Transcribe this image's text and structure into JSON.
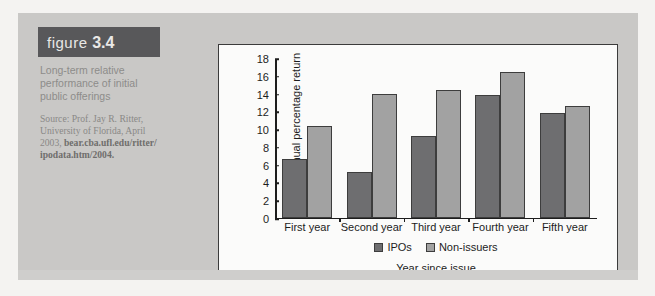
{
  "figure": {
    "label_prefix": "figure",
    "number": "3.4",
    "caption_lines": [
      "Long-term relative",
      "performance of initial",
      "public offerings"
    ],
    "source_lines": [
      "Source: Prof. Jay R. Ritter,",
      "University of Florida, April",
      "2003, bear.cba.ufl.edu/ritter/",
      "ipodata.htm/2004."
    ]
  },
  "chart_data": {
    "type": "bar",
    "title": "",
    "categories": [
      "First year",
      "Second year",
      "Third year",
      "Fourth year",
      "Fifth year"
    ],
    "series": [
      {
        "name": "IPOs",
        "color": "#6e6e70",
        "values": [
          6.6,
          5.1,
          9.2,
          13.8,
          11.8
        ]
      },
      {
        "name": "Non-issuers",
        "color": "#a2a2a2",
        "values": [
          10.3,
          13.9,
          14.3,
          16.4,
          12.5
        ]
      }
    ],
    "xlabel": "Year since issue",
    "ylabel": "Annual percentage return",
    "ylim": [
      0,
      18
    ],
    "ytick_step": 2,
    "yticks": [
      0,
      2,
      4,
      6,
      8,
      10,
      12,
      14,
      16,
      18
    ],
    "grid": false,
    "legend_position": "bottom"
  }
}
